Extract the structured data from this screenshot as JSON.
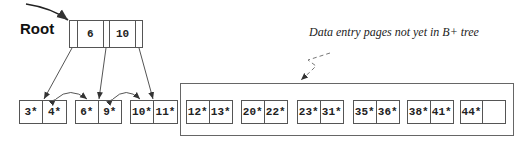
{
  "root_label": "Root",
  "annotation": "Data entry pages not yet in B+ tree",
  "root_node": {
    "keys": [
      "6",
      "10"
    ]
  },
  "indexed_leaves": [
    {
      "entries": [
        "3*",
        "4*"
      ]
    },
    {
      "entries": [
        "6*",
        "9*"
      ]
    },
    {
      "entries": [
        "10*",
        "11*"
      ]
    }
  ],
  "unindexed_leaves": [
    {
      "entries": [
        "12*",
        "13*"
      ]
    },
    {
      "entries": [
        "20*",
        "22*"
      ]
    },
    {
      "entries": [
        "23*",
        "31*"
      ]
    },
    {
      "entries": [
        "35*",
        "36*"
      ]
    },
    {
      "entries": [
        "38*",
        "41*"
      ]
    },
    {
      "entries": [
        "44*",
        ""
      ]
    }
  ],
  "colors": {
    "line": "#555555",
    "text": "#222222"
  }
}
